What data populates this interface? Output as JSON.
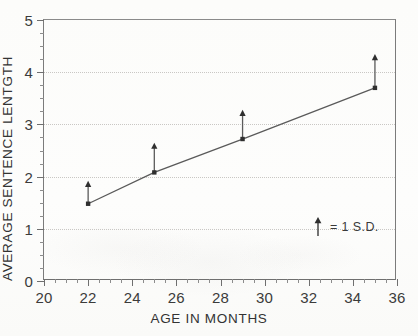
{
  "chart_data": {
    "type": "line",
    "title": "",
    "xlabel": "AGE IN MONTHS",
    "ylabel": "AVERAGE SENTENCE LENTGTH",
    "x": [
      22,
      25,
      29,
      35
    ],
    "values": [
      1.48,
      2.08,
      2.72,
      3.7
    ],
    "series": [
      {
        "name": "Average sentence length",
        "x": [
          22,
          25,
          29,
          35
        ],
        "values": [
          1.48,
          2.08,
          2.72,
          3.7
        ],
        "error_upper": [
          0.44,
          0.57,
          0.56,
          0.65
        ],
        "error_tip_values": [
          1.92,
          2.65,
          3.28,
          4.35
        ]
      }
    ],
    "xlim": [
      20,
      36
    ],
    "ylim": [
      0,
      5
    ],
    "xticks": [
      20,
      22,
      24,
      26,
      28,
      30,
      32,
      34,
      36
    ],
    "xtick_labels": [
      "20",
      "22",
      "24",
      "26",
      "28",
      "30",
      "32",
      "34",
      "36"
    ],
    "yticks": [
      0,
      1,
      2,
      3,
      4,
      5
    ],
    "ytick_labels": [
      "0",
      "1",
      "2",
      "3",
      "4",
      "5"
    ],
    "x_minor_step": 0.5,
    "y_minor_step": 0.25,
    "grid": {
      "horizontal": true,
      "vertical": false,
      "values": [
        1,
        2,
        3,
        4
      ],
      "style": "dotted",
      "color": "#c9c7c4"
    },
    "annotations": [
      {
        "name": "error-bar-legend",
        "icon": "up-arrow-icon",
        "text": "= 1 S.D.",
        "x": 32.5,
        "y": 0.95
      }
    ],
    "legend": {
      "position": "inside-lower-right",
      "arrow_symbol": "up-arrow-icon",
      "label": "= 1 S.D."
    },
    "colors": {
      "line": "#5a5a5a",
      "marker": "#2f2f2f",
      "axis": "#6f6f6f",
      "grid": "#c9c7c4",
      "text": "#333333",
      "background": "#fdfdfc"
    },
    "marker": "square"
  }
}
